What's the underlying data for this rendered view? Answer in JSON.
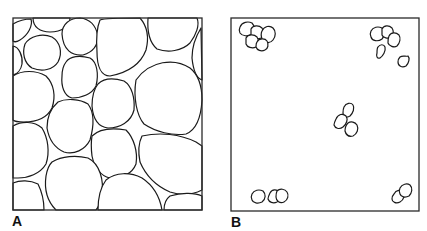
{
  "figure": {
    "panels": [
      {
        "id": "A",
        "label": "A",
        "description": "Densely packed polygonal cells filling the field",
        "frame": {
          "x": 13,
          "y": 18,
          "w": 189,
          "h": 192
        },
        "label_pos": {
          "x": 12,
          "y": 214
        }
      },
      {
        "id": "B",
        "label": "B",
        "description": "Sparse small cell clusters at corners and center",
        "frame": {
          "x": 231,
          "y": 18,
          "w": 188,
          "h": 193
        },
        "label_pos": {
          "x": 231,
          "y": 215
        }
      }
    ]
  },
  "cells_a": [
    "M13,24 C20,20 28,19 31,19 C33,26 28,35 20,40 C17,42 14,42 13,41 Z",
    "M33,18 L70,18 C70,26 62,32 50,32 C40,32 33,27 33,18 Z",
    "M25,44 C30,36 42,33 52,37 C60,42 63,52 58,62 C53,70 42,72 32,68 C24,63 22,53 25,44 Z",
    "M13,46 C19,47 23,56 22,64 C21,70 17,74 13,75 Z",
    "M62,34 C62,24 70,18 80,18 C90,19 96,26 98,36 C98,46 93,52 83,55 C72,56 63,50 62,34 Z",
    "M100,20 C105,18 125,18 140,18 C147,26 149,38 146,50 C140,66 126,73 110,76 C101,76 97,66 97,52 C96,38 97,27 100,20 Z",
    "M148,18 L197,18 C200,25 196,35 190,43 C182,51 168,53 157,49 C150,43 147,32 148,18 Z",
    "M201,28 L202,80 C196,78 193,68 192,58 C192,46 196,36 201,28 Z",
    "M66,62 C70,56 80,55 90,58 C97,62 99,74 96,86 C92,94 82,98 72,98 C64,96 61,86 62,76 C62,70 63,66 66,62 Z",
    "M13,76 C22,70 36,70 46,76 C54,84 56,96 52,108 C47,118 36,122 24,122 C18,122 14,121 13,120 Z",
    "M98,84 C104,78 114,78 124,81 C132,86 135,98 134,110 C131,122 120,128 108,128 C98,127 93,118 92,106 C92,96 94,89 98,84 Z",
    "M136,80 C150,60 175,58 190,68 C200,76 202,90 202,100 C201,118 196,130 186,134 C172,136 156,132 144,124 C137,116 133,98 136,80 Z",
    "M58,102 C66,98 80,99 88,104 C94,112 94,126 90,140 C85,150 74,155 64,152 C55,148 49,140 47,128 C47,116 51,108 58,102 Z",
    "M13,126 C22,121 34,121 42,128 C48,138 50,152 46,164 C40,174 28,178 18,178 L13,178 Z",
    "M92,136 C100,128 114,128 126,130 C134,138 138,152 136,164 C132,174 122,178 110,178 C100,176 94,166 92,156 C91,148 91,142 92,136 Z",
    "M142,136 C160,132 180,134 196,142 L202,146 L202,190 C194,194 182,196 170,192 C156,186 146,176 140,162 C138,152 139,142 142,136 Z",
    "M52,162 C62,156 76,155 88,158 C100,164 104,180 102,196 C100,204 98,208 96,210 L56,210 C48,202 44,190 46,176 C47,170 49,165 52,162 Z",
    "M13,183 C20,180 30,180 38,184 C42,192 44,202 44,210 L13,210 Z",
    "M106,180 C116,172 130,172 142,178 C154,186 160,198 162,210 L98,210 C98,200 100,188 106,180 Z",
    "M170,196 C180,193 194,192 202,196 L202,210 L164,210 C164,204 166,199 170,196 Z"
  ],
  "cells_b": [
    "M240,27 C242,22 248,21 252,23 C255,26 255,31 252,34 C248,37 242,36 240,33 C239,31 239,29 240,27 Z",
    "M251,29 C253,25 259,25 262,28 C264,31 264,36 261,38 C257,40 252,38 251,35 Z",
    "M262,31 C264,26 270,25 273,28 C276,31 276,36 273,40 C270,44 264,43 262,39 C261,36 261,33 262,31 Z",
    "M246,38 C248,34 254,34 257,37 C259,40 259,45 256,47 C252,49 247,47 246,44 Z",
    "M257,42 C259,38 265,38 267,41 C269,44 268,49 265,50 C261,52 257,50 256,47 C256,45 256,43 257,42 Z",
    "M371,31 C373,27 378,26 382,28 C385,31 385,36 382,39 C378,42 372,41 371,37 C370,35 370,33 371,31 Z",
    "M382,29 C384,25 389,25 392,28 C394,31 394,35 391,37 C388,39 383,38 382,35 Z",
    "M389,36 C391,32 396,32 399,35 C401,38 400,43 397,46 C394,48 389,46 388,43 C388,40 388,38 389,36 Z",
    "M378,47 C380,44 384,44 385,47 C386,51 383,56 380,58 C377,59 376,56 377,53 C377,50 377,48 378,47 Z",
    "M400,57 C403,55 406,57 408,56 C410,58 409,63 406,66 C402,68 398,66 398,62 C398,60 399,58 400,57 Z",
    "M344,107 C346,103 351,102 353,105 C355,108 353,113 350,116 C347,118 343,117 343,113 C343,111 343,109 344,107 Z",
    "M336,119 C338,114 343,113 346,116 C348,119 347,124 343,127 C339,130 335,128 334,125 C334,123 335,121 336,119 Z",
    "M348,123 C351,121 355,122 357,125 C359,129 357,134 353,136 C349,137 346,135 345,131 C345,128 346,125 348,123 Z",
    "M252,194 C254,190 259,189 263,191 C266,194 266,199 262,202 C258,204 253,203 252,200 C251,198 251,196 252,194 Z",
    "M270,193 C272,189 277,189 279,192 C281,195 280,200 277,202 C273,204 269,202 268,199 C268,197 269,195 270,193 Z",
    "M277,191 C280,188 285,189 287,192 C289,195 288,200 284,202 C280,204 276,201 276,197 C276,195 276,193 277,191 Z",
    "M394,194 C396,190 401,189 403,192 C405,195 404,200 400,202 C396,204 392,202 392,199 C392,197 393,195 394,194 Z",
    "M400,188 C402,184 407,183 410,185 C413,188 412,193 409,196 C405,198 401,197 400,194 C399,192 399,190 400,188 Z"
  ]
}
